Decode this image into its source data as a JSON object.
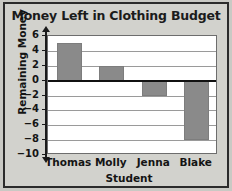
{
  "chart_data": {
    "type": "bar",
    "title": "Money Left in Clothing Budget",
    "xlabel": "Student",
    "ylabel": "Remaining Money",
    "categories": [
      "Thomas",
      "Molly",
      "Jenna",
      "Blake"
    ],
    "values": [
      5,
      2,
      -2,
      -8
    ],
    "ylim": [
      -10,
      6
    ],
    "ytick_step": 2,
    "yticks": [
      6,
      4,
      2,
      0,
      -2,
      -4,
      -6,
      -8,
      -10
    ],
    "ytick_labels": [
      "6",
      "4",
      "2",
      "0",
      "−2",
      "−4",
      "−6",
      "−8",
      "−10"
    ],
    "grid": true,
    "legend": null,
    "bar_color": "#8a8a8a",
    "plot_background": "#ffffff",
    "page_background": "#d2d2cd",
    "zero_line_color": "#111111"
  }
}
